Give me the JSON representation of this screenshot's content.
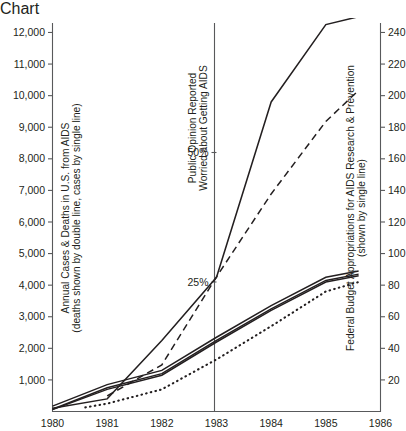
{
  "chart_data": {
    "type": "line",
    "title": "",
    "xlabel": "",
    "x": [
      1980,
      1981,
      1982,
      1983,
      1984,
      1985,
      1986
    ],
    "xlim": [
      1980,
      1986
    ],
    "grid": false,
    "legend_position": "none",
    "axes": {
      "left": {
        "label_line1": "Annual Cases & Deaths in U.S. from AIDS",
        "label_line2": "(deaths shown by double line, cases by single line)",
        "ticks": [
          1000,
          2000,
          3000,
          4000,
          5000,
          6000,
          7000,
          8000,
          9000,
          10000,
          11000,
          12000
        ],
        "tick_labels": [
          "1,000",
          "2,000",
          "3,000",
          "4,000",
          "5,000",
          "6,000",
          "7,000",
          "8,000",
          "9,000",
          "10,000",
          "11,000",
          "12,000"
        ],
        "ylim": [
          0,
          12300
        ]
      },
      "middle": {
        "label_line1": "Public Opinion Reported",
        "label_line2": "Worried about Getting AIDS",
        "ticks": [
          25,
          50
        ],
        "tick_labels": [
          "25%",
          "50%"
        ],
        "ylim": [
          0,
          75
        ],
        "position_year": 1983
      },
      "right": {
        "label_line1": "Federal Budget Appropriations for AIDS Research & Prevention",
        "label_line2": "(shown by single line)",
        "ticks": [
          20,
          40,
          60,
          80,
          100,
          120,
          140,
          160,
          180,
          200,
          220,
          240
        ],
        "tick_labels": [
          "20",
          "40",
          "60",
          "80",
          "100",
          "120",
          "140",
          "160",
          "180",
          "200",
          "220",
          "240"
        ],
        "ylim": [
          0,
          246
        ]
      }
    },
    "series": [
      {
        "name": "Federal Budget Appropriations for AIDS Research & Prevention",
        "style": "single line",
        "axis": "right",
        "x": [
          1980,
          1981,
          1982,
          1983,
          1984,
          1985,
          1985.6
        ],
        "values": [
          2,
          8,
          45,
          85,
          196,
          245,
          250
        ]
      },
      {
        "name": "Deaths in U.S. from AIDS",
        "style": "double line",
        "axis": "left",
        "x": [
          1980,
          1981,
          1982,
          1983,
          1984,
          1985,
          1985.6
        ],
        "values": [
          120,
          800,
          1250,
          2300,
          3300,
          4200,
          4400
        ]
      },
      {
        "name": "Annual Cases in U.S. from AIDS",
        "style": "single line",
        "axis": "left",
        "x": [
          1980,
          1981,
          1982,
          1983,
          1984,
          1985,
          1985.6
        ],
        "values": [
          60,
          700,
          1150,
          2200,
          3200,
          4100,
          4300
        ]
      },
      {
        "name": "Public Opinion Reported Worried about Getting AIDS",
        "style": "dashed line",
        "axis": "middle",
        "x": [
          1981,
          1982,
          1983,
          1984,
          1985,
          1985.6
        ],
        "values": [
          3,
          9,
          26,
          42,
          56,
          62
        ]
      },
      {
        "name": "Dotted series",
        "style": "dotted line",
        "axis": "left",
        "x": [
          1980.6,
          1981,
          1982,
          1983,
          1984,
          1985,
          1985.6
        ],
        "values": [
          130,
          250,
          700,
          1650,
          2700,
          3800,
          4100
        ]
      }
    ]
  }
}
